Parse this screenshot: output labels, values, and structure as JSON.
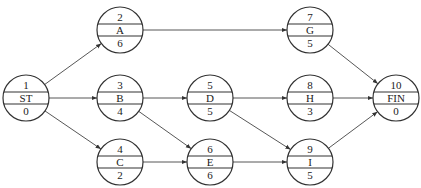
{
  "diagram": {
    "type": "activity-on-node network",
    "nodes": [
      {
        "id": "ST",
        "number": "1",
        "label": "ST",
        "duration": "0",
        "cx": 26,
        "cy": 98
      },
      {
        "id": "A",
        "number": "2",
        "label": "A",
        "duration": "6",
        "cx": 120,
        "cy": 30
      },
      {
        "id": "B",
        "number": "3",
        "label": "B",
        "duration": "4",
        "cx": 120,
        "cy": 98
      },
      {
        "id": "C",
        "number": "4",
        "label": "C",
        "duration": "2",
        "cx": 120,
        "cy": 162
      },
      {
        "id": "D",
        "number": "5",
        "label": "D",
        "duration": "5",
        "cx": 210,
        "cy": 98
      },
      {
        "id": "E",
        "number": "6",
        "label": "E",
        "duration": "6",
        "cx": 210,
        "cy": 162
      },
      {
        "id": "G",
        "number": "7",
        "label": "G",
        "duration": "5",
        "cx": 310,
        "cy": 30
      },
      {
        "id": "H",
        "number": "8",
        "label": "H",
        "duration": "3",
        "cx": 310,
        "cy": 98
      },
      {
        "id": "I",
        "number": "9",
        "label": "I",
        "duration": "5",
        "cx": 310,
        "cy": 162
      },
      {
        "id": "FIN",
        "number": "10",
        "label": "FIN",
        "duration": "0",
        "cx": 396,
        "cy": 98
      }
    ],
    "edges": [
      {
        "from": "ST",
        "to": "A"
      },
      {
        "from": "ST",
        "to": "B"
      },
      {
        "from": "ST",
        "to": "C"
      },
      {
        "from": "A",
        "to": "G"
      },
      {
        "from": "B",
        "to": "D"
      },
      {
        "from": "B",
        "to": "E"
      },
      {
        "from": "C",
        "to": "E"
      },
      {
        "from": "D",
        "to": "H"
      },
      {
        "from": "D",
        "to": "I"
      },
      {
        "from": "E",
        "to": "I"
      },
      {
        "from": "G",
        "to": "FIN"
      },
      {
        "from": "H",
        "to": "FIN"
      },
      {
        "from": "I",
        "to": "FIN"
      }
    ]
  }
}
